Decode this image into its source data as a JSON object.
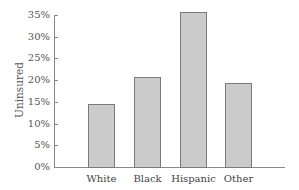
{
  "chart_data": {
    "type": "bar",
    "title": "",
    "xlabel": "",
    "ylabel": "Uninsured",
    "categories": [
      "White",
      "Black",
      "Hispanic",
      "Other"
    ],
    "values": [
      14.5,
      20.7,
      35.7,
      19.4
    ],
    "value_format": "percent",
    "ylim": [
      0,
      35
    ],
    "yticks": [
      0,
      5,
      10,
      15,
      20,
      25,
      30,
      35
    ],
    "ytick_labels": [
      "0%",
      "5%",
      "10%",
      "15%",
      "20%",
      "25%",
      "30%",
      "35%"
    ],
    "grid": false,
    "legend": null,
    "bar_fill": "#cbcbcb",
    "bar_edge": "#7a7a7a"
  }
}
